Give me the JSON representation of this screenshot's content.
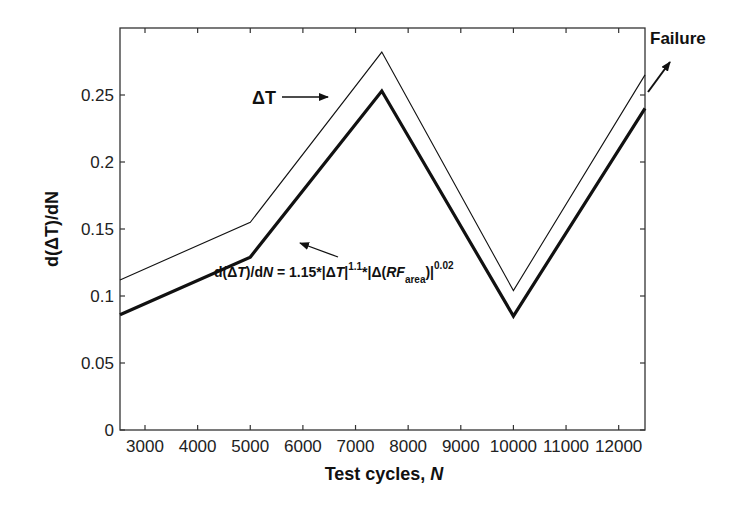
{
  "chart_data": {
    "type": "line",
    "title": "",
    "xlabel": "Test cycles, N",
    "ylabel": "d(ΔT)/dN",
    "xlim": [
      2525,
      12500
    ],
    "ylim": [
      0,
      0.29
    ],
    "grid": false,
    "legend": null,
    "x_ticks": [
      3000,
      4000,
      5000,
      6000,
      7000,
      8000,
      9000,
      10000,
      11000,
      12000
    ],
    "x_tick_labels": [
      "3000",
      "4000",
      "5000",
      "6000",
      "7000",
      "8000",
      "9000",
      "10000",
      "11000",
      "12000"
    ],
    "y_ticks": [
      0,
      0.05,
      0.1,
      0.15,
      0.2,
      0.25
    ],
    "y_tick_labels": [
      "0",
      "0.05",
      "0.1",
      "0.15",
      "0.2",
      "0.25"
    ],
    "series": [
      {
        "name": "ΔT",
        "style": "thin",
        "x": [
          2525,
          5000,
          7500,
          10000,
          12500
        ],
        "values": [
          0.112,
          0.155,
          0.282,
          0.104,
          0.265
        ]
      },
      {
        "name": "d(ΔT)/dN = 1.15*|ΔT|^1.1*|Δ(RF_area)|^0.02",
        "style": "thick",
        "x": [
          2525,
          5000,
          7500,
          10000,
          12500
        ],
        "values": [
          0.086,
          0.129,
          0.253,
          0.085,
          0.24
        ]
      }
    ],
    "annotations": [
      {
        "text": "ΔT",
        "type": "arrow-label",
        "points_to": "thin series near x=7000"
      },
      {
        "text": "d(ΔT)/dN = 1.15*|ΔT|^1.1*|Δ(RF_area)|^0.02",
        "type": "arrow-label",
        "points_to": "thick series near x=5500"
      },
      {
        "text": "Failure",
        "type": "arrow-label",
        "position": "top-right outside plot"
      }
    ]
  },
  "labels": {
    "xlabel_main": "Test cycles, ",
    "xlabel_var": "N",
    "ylabel": "d(ΔT)/dN",
    "delta_t": "ΔT",
    "failure": "Failure",
    "formula": {
      "p1": "d(Δ",
      "p2": "T",
      "p3": ")/d",
      "p4": "N",
      "p5": " = 1.15*|Δ",
      "p6": "T",
      "p7": "|",
      "exp1": "1.1",
      "p8": "*|Δ(",
      "p9": "RF",
      "sub": "area",
      "p10": ")|",
      "exp2": "0.02"
    }
  }
}
